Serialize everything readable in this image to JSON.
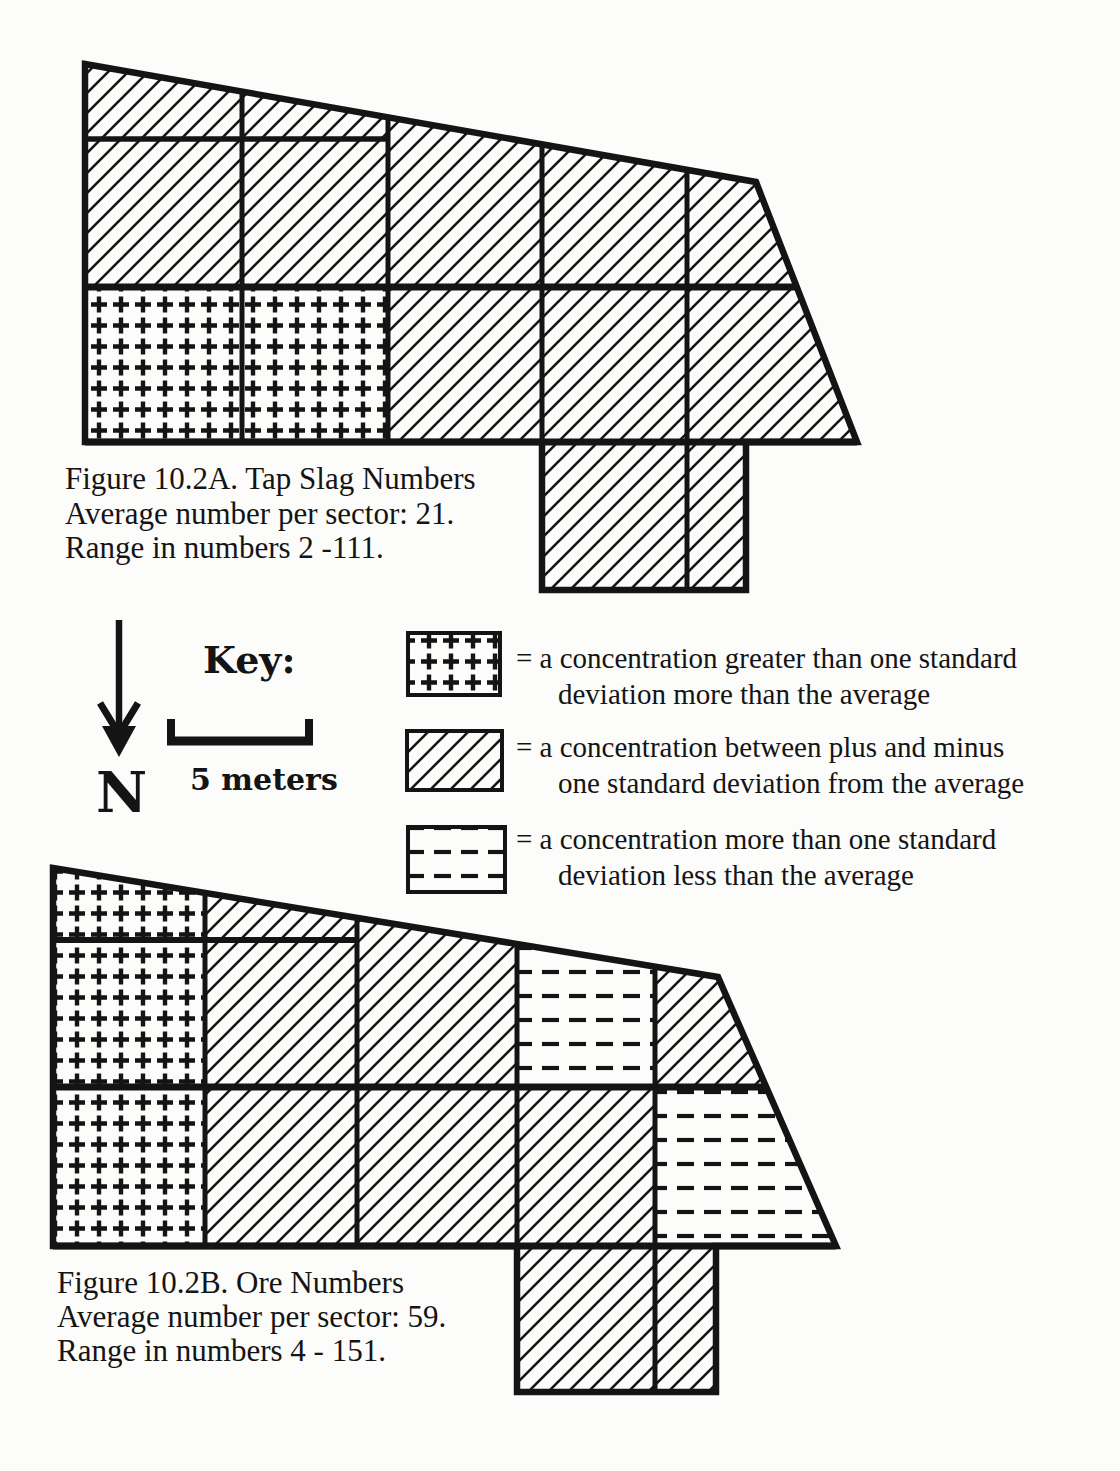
{
  "page": {
    "ink_color": "#141414",
    "paper_color": "#fcfcfb"
  },
  "figure_a": {
    "caption": {
      "line1": "Figure 10.2A. Tap Slag Numbers",
      "line2": "Average number per sector: 21.",
      "line3": "Range in numbers 2 -111."
    },
    "sectors": [
      {
        "id": "r1c1",
        "pattern": "hatch"
      },
      {
        "id": "r1c2",
        "pattern": "hatch"
      },
      {
        "id": "r2c1",
        "pattern": "hatch"
      },
      {
        "id": "r2c2",
        "pattern": "hatch"
      },
      {
        "id": "r2c3",
        "pattern": "hatch"
      },
      {
        "id": "r2c4",
        "pattern": "hatch"
      },
      {
        "id": "r2c5",
        "pattern": "hatch"
      },
      {
        "id": "r3c1",
        "pattern": "plus"
      },
      {
        "id": "r3c2",
        "pattern": "plus"
      },
      {
        "id": "r3c3",
        "pattern": "hatch"
      },
      {
        "id": "r3c4",
        "pattern": "hatch"
      },
      {
        "id": "r3c5",
        "pattern": "hatch"
      },
      {
        "id": "tab-west",
        "pattern": "hatch"
      },
      {
        "id": "tab-east",
        "pattern": "hatch"
      }
    ]
  },
  "figure_b": {
    "caption": {
      "line1": "Figure 10.2B. Ore Numbers",
      "line2": "Average number per sector: 59.",
      "line3": "Range in numbers 4 - 151."
    },
    "sectors": [
      {
        "id": "r1c1",
        "pattern": "plus"
      },
      {
        "id": "r1c2",
        "pattern": "hatch"
      },
      {
        "id": "r2c1",
        "pattern": "plus"
      },
      {
        "id": "r2c2",
        "pattern": "hatch"
      },
      {
        "id": "r2c3",
        "pattern": "hatch"
      },
      {
        "id": "r2c4",
        "pattern": "dash"
      },
      {
        "id": "r2c5",
        "pattern": "hatch"
      },
      {
        "id": "r3c1",
        "pattern": "plus"
      },
      {
        "id": "r3c2",
        "pattern": "hatch"
      },
      {
        "id": "r3c3",
        "pattern": "hatch"
      },
      {
        "id": "r3c4",
        "pattern": "hatch"
      },
      {
        "id": "r3c5",
        "pattern": "dash"
      },
      {
        "id": "tab-west",
        "pattern": "hatch"
      },
      {
        "id": "tab-east",
        "pattern": "hatch"
      }
    ]
  },
  "key": {
    "heading": "Key:",
    "north_label": "N",
    "scale_label": "5 meters",
    "entries": [
      {
        "pattern": "plus",
        "line1": "= a concentration greater than one standard",
        "line2": "deviation more than the average"
      },
      {
        "pattern": "hatch",
        "line1": "= a concentration between plus and minus",
        "line2": "one standard deviation from the average"
      },
      {
        "pattern": "dash",
        "line1": "= a concentration more than one standard",
        "line2": "deviation less than the average"
      }
    ]
  }
}
